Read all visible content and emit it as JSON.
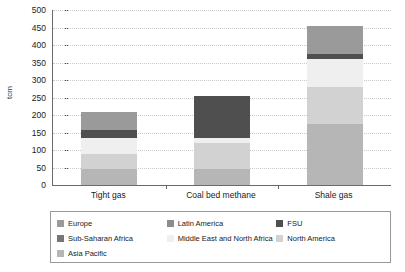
{
  "chart_data": {
    "type": "bar",
    "title": "",
    "subtitle": "",
    "stacked": true,
    "xlabel": "",
    "ylabel": "tcm",
    "ylim": [
      0,
      500
    ],
    "ytick_step": 50,
    "yticks": [
      500,
      450,
      400,
      350,
      300,
      250,
      200,
      150,
      100,
      50,
      0
    ],
    "grid": true,
    "grid_axis": "y",
    "legend_position": "bottom",
    "categories": [
      "Tight gas",
      "Coal bed methane",
      "Shale gas"
    ],
    "series": [
      {
        "name": "Asia Pacific",
        "color": "#b6b6b6",
        "values": [
          47,
          47,
          175
        ]
      },
      {
        "name": "North America",
        "color": "#d2d2d2",
        "values": [
          41,
          73,
          105
        ]
      },
      {
        "name": "Middle East and North Africa",
        "color": "#efefef",
        "values": [
          45,
          13,
          80
        ]
      },
      {
        "name": "FSU",
        "color": "#4f4f4f",
        "values": [
          24,
          122,
          15
        ]
      },
      {
        "name": "Europe",
        "color": "#9a9a9a",
        "values": [
          53,
          0,
          78
        ]
      },
      {
        "name": "Latin America",
        "color": "#8c8c8c",
        "values": [
          0,
          0,
          0
        ]
      },
      {
        "name": "Sub-Saharan Africa",
        "color": "#767676",
        "values": [
          0,
          0,
          0
        ]
      }
    ],
    "totals": [
      210,
      255,
      453
    ],
    "legend_order": [
      "Europe",
      "Latin America",
      "FSU",
      "Sub-Saharan Africa",
      "Middle East and North Africa",
      "North America",
      "Asia Pacific"
    ]
  },
  "legend": {
    "entries": [
      {
        "label": "Europe",
        "color": "#9a9a9a"
      },
      {
        "label": "Latin America",
        "color": "#8c8c8c"
      },
      {
        "label": "FSU",
        "color": "#4f4f4f"
      },
      {
        "label": "Sub-Saharan Africa",
        "color": "#767676"
      },
      {
        "label": "Middle East and North Africa",
        "color": "#efefef"
      },
      {
        "label": "North America",
        "color": "#d2d2d2"
      },
      {
        "label": "Asia Pacific",
        "color": "#b6b6b6"
      }
    ]
  },
  "colors": {
    "axis": "#6a6a6a",
    "grid": "#c9c9c9",
    "text": "#1a1a1a",
    "legend_border": "#9a9a9a",
    "background": "#ffffff"
  }
}
